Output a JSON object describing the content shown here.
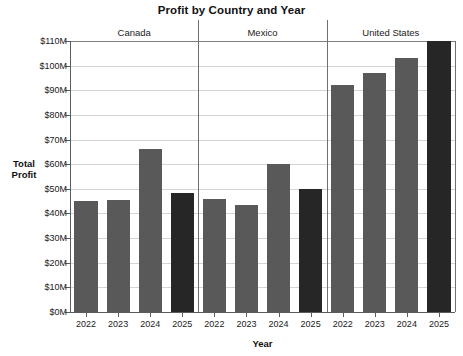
{
  "chart_data": {
    "type": "bar",
    "title": "Profit by Country and Year",
    "xlabel": "Year",
    "ylabel": "Total Profit",
    "groups": [
      "Canada",
      "Mexico",
      "United States"
    ],
    "categories": [
      "2022",
      "2023",
      "2024",
      "2025"
    ],
    "series": [
      {
        "name": "Canada",
        "values": [
          45,
          45.5,
          66,
          48.5
        ]
      },
      {
        "name": "Mexico",
        "values": [
          46,
          43.5,
          60,
          50
        ]
      },
      {
        "name": "United States",
        "values": [
          92,
          97,
          103,
          112
        ]
      }
    ],
    "ylim": [
      0,
      110
    ],
    "ytick_labels": [
      "$0M",
      "$10M",
      "$20M",
      "$30M",
      "$40M",
      "$50M",
      "$60M",
      "$70M",
      "$80M",
      "$90M",
      "$100M",
      "$110M"
    ],
    "ytick_values": [
      0,
      10,
      20,
      30,
      40,
      50,
      60,
      70,
      80,
      90,
      100,
      110
    ],
    "grid": true,
    "legend": "none",
    "colors": {
      "bar_default": "#595959",
      "bar_highlight": "#262626",
      "gridline": "#d4d4d4",
      "axis": "#5c5c5c",
      "background": "#ffffff",
      "text": "#1a1a1a"
    },
    "highlight_category": "2025",
    "note": "United States 2025 bar exceeds the $110M axis maximum and is clipped at the top of the plot area."
  }
}
